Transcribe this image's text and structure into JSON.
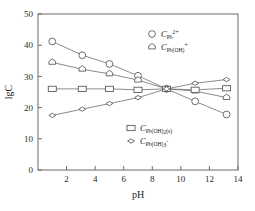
{
  "chart_data": {
    "type": "line",
    "title": "",
    "xlabel": "pH",
    "ylabel": "lgC",
    "xlim": [
      0,
      14
    ],
    "ylim": [
      0,
      50
    ],
    "xticks": [
      2,
      4,
      6,
      8,
      10,
      12,
      14
    ],
    "yticks": [
      0,
      10,
      20,
      30,
      40,
      50
    ],
    "grid": false,
    "legend_position": "inside",
    "series": [
      {
        "name": "C_Pb2+",
        "label_base": "C",
        "label_sub": "Pb",
        "label_sup": "2+",
        "marker": "circle",
        "x": [
          1.0,
          3.1,
          5.0,
          7.0,
          9.0,
          11.0,
          13.2
        ],
        "y": [
          41.2,
          36.8,
          34.0,
          30.2,
          26.0,
          22.0,
          17.8
        ]
      },
      {
        "name": "C_Pb(OH)+",
        "label_base": "C",
        "label_sub": "Pb(OH)",
        "label_sup": "+",
        "marker": "hexagon",
        "x": [
          1.0,
          3.1,
          5.0,
          7.0,
          9.0,
          11.0,
          13.2
        ],
        "y": [
          34.5,
          32.3,
          30.8,
          28.8,
          26.0,
          25.3,
          23.2
        ]
      },
      {
        "name": "C_Pb(OH)2(s)",
        "label_base": "C",
        "label_sub": "Pb(OH)2(s)",
        "label_sup": "",
        "marker": "square",
        "x": [
          1.0,
          3.1,
          5.0,
          7.0,
          9.0,
          11.0,
          13.2
        ],
        "y": [
          26.0,
          26.0,
          26.0,
          25.7,
          26.0,
          25.7,
          26.2
        ]
      },
      {
        "name": "C_Pb(OH)3-",
        "label_base": "C",
        "label_sub": "Pb(OH)3",
        "label_sup": "-",
        "marker": "diamond",
        "x": [
          1.0,
          3.1,
          5.0,
          7.0,
          9.0,
          11.0,
          13.2
        ],
        "y": [
          17.5,
          19.5,
          21.3,
          23.2,
          26.0,
          27.8,
          29.0
        ]
      }
    ]
  },
  "legend": {
    "top": [
      {
        "base": "C",
        "sub": "Pb",
        "sup": "2+",
        "marker": "circle"
      },
      {
        "base": "C",
        "sub": "Pb(OH)",
        "sup": "+",
        "marker": "hexagon"
      }
    ],
    "bottom": [
      {
        "base": "C",
        "sub": "Pb(OH)",
        "sub2": "2",
        "sub3": "(s)",
        "sup": "",
        "marker": "square"
      },
      {
        "base": "C",
        "sub": "Pb(OH)",
        "sub2": "3",
        "sub3": "",
        "sup": "-",
        "marker": "diamond"
      }
    ]
  }
}
